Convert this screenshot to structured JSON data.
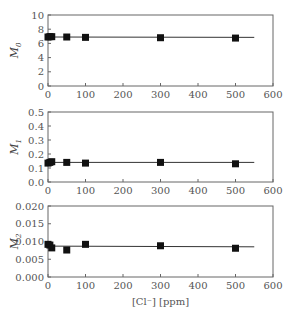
{
  "chart_data": [
    {
      "type": "scatter",
      "panel": "top",
      "ylabel": "M0",
      "ylabel_main": "M",
      "ylabel_sub": "0",
      "xlabel": "",
      "xlim": [
        0,
        600
      ],
      "ylim": [
        0,
        10
      ],
      "xticks": [
        0,
        100,
        200,
        300,
        400,
        500,
        600
      ],
      "yticks": [
        0,
        2,
        4,
        6,
        8,
        10
      ],
      "ytick_labels": [
        "0",
        "2",
        "4",
        "6",
        "8",
        "10"
      ],
      "grid": false,
      "fit_line": {
        "x": [
          0,
          550
        ],
        "y": [
          6.9,
          6.85
        ]
      },
      "series": [
        {
          "name": "M0",
          "marker": "square",
          "x": [
            0,
            5,
            10,
            50,
            100,
            300,
            500
          ],
          "y": [
            6.9,
            6.95,
            6.95,
            6.9,
            6.85,
            6.8,
            6.75
          ]
        }
      ]
    },
    {
      "type": "scatter",
      "panel": "middle",
      "ylabel": "M1",
      "ylabel_main": "M",
      "ylabel_sub": "1",
      "xlabel": "",
      "xlim": [
        0,
        600
      ],
      "ylim": [
        0,
        0.5
      ],
      "xticks": [
        0,
        100,
        200,
        300,
        400,
        500,
        600
      ],
      "yticks": [
        0,
        0.1,
        0.2,
        0.3,
        0.4,
        0.5
      ],
      "ytick_labels": [
        "0.0",
        "0.1",
        "0.2",
        "0.3",
        "0.4",
        "0.5"
      ],
      "grid": false,
      "fit_line": {
        "x": [
          0,
          550
        ],
        "y": [
          0.14,
          0.14
        ]
      },
      "series": [
        {
          "name": "M1",
          "marker": "square",
          "x": [
            0,
            5,
            10,
            50,
            100,
            300,
            500
          ],
          "y": [
            0.135,
            0.14,
            0.145,
            0.14,
            0.135,
            0.14,
            0.13
          ]
        }
      ]
    },
    {
      "type": "scatter",
      "panel": "bottom",
      "ylabel": "M2",
      "ylabel_main": "M",
      "ylabel_sub": "2",
      "xlabel": "[Cl⁻] [ppm]",
      "xlim": [
        0,
        600
      ],
      "ylim": [
        0,
        0.02
      ],
      "xticks": [
        0,
        100,
        200,
        300,
        400,
        500,
        600
      ],
      "yticks": [
        0,
        0.005,
        0.01,
        0.015,
        0.02
      ],
      "ytick_labels": [
        "0.000",
        "0.005",
        "0.010",
        "0.015",
        "0.020"
      ],
      "grid": false,
      "fit_line": {
        "x": [
          0,
          550
        ],
        "y": [
          0.0087,
          0.0085
        ]
      },
      "series": [
        {
          "name": "M2",
          "marker": "square",
          "x": [
            0,
            5,
            10,
            50,
            100,
            300,
            500
          ],
          "y": [
            0.0092,
            0.009,
            0.0082,
            0.0076,
            0.0092,
            0.0088,
            0.0081
          ]
        }
      ]
    }
  ],
  "xtick_labels": [
    "0",
    "100",
    "200",
    "300",
    "400",
    "500",
    "600"
  ],
  "bottom_xlabel": "[Cl⁻] [ppm]",
  "colors": {
    "marker": "#111111",
    "frame": "#666666",
    "fit_line": "#333333"
  }
}
